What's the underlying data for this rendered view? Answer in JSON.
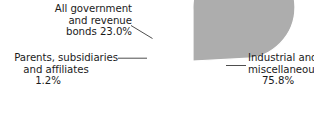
{
  "chart_data": {
    "type": "pie",
    "title": "",
    "categories": [
      "All government and revenue bonds",
      "Parents, subsidiaries and affiliates",
      "Industrial and miscellaneous"
    ],
    "values": [
      23.0,
      1.2,
      75.8
    ],
    "value_suffix": "%",
    "legend": "none",
    "grid": false,
    "slice_colors": [
      "#8e8e8e",
      "#b3b3b3",
      "#adadad"
    ],
    "slice_border_color": "#ffffff",
    "start_angle_deg": 90,
    "direction": "counterclockwise",
    "labels": [
      {
        "name": "all-government-and-revenue-bonds",
        "lines": [
          "All government",
          "and revenue",
          "bonds 23.0%"
        ],
        "value": 23.0,
        "value_text": "23.0%"
      },
      {
        "name": "parents-subsidiaries-and-affiliates",
        "lines": [
          "Parents, subsidiaries",
          "and affiliates",
          "1.2%"
        ],
        "value": 1.2,
        "value_text": "1.2%"
      },
      {
        "name": "industrial-and-miscellaneous",
        "lines": [
          "Industrial and",
          "miscellaneous",
          "75.8%"
        ],
        "value": 75.8,
        "value_text": "75.8%"
      }
    ]
  },
  "top_cropped_text": "",
  "geometry": {
    "center_x": 193,
    "center_y": 61,
    "radius": 51
  }
}
